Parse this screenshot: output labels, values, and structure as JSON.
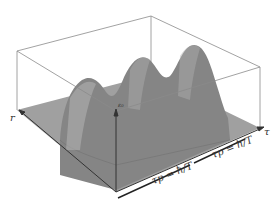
{
  "figure": {
    "axes": {
      "r_label": "r",
      "tau_label": "τ",
      "vertical_label": "ε₀"
    },
    "annotations": [
      {
        "id": "period-1",
        "text": "τp = ħ/T"
      },
      {
        "id": "period-2",
        "text": "τp = ħ/T"
      }
    ],
    "peaks_count": 3,
    "colors": {
      "box": "#8a8a8a",
      "floor": "#9d9d9d",
      "surface": "#7d7d7d",
      "text": "#333333"
    }
  }
}
